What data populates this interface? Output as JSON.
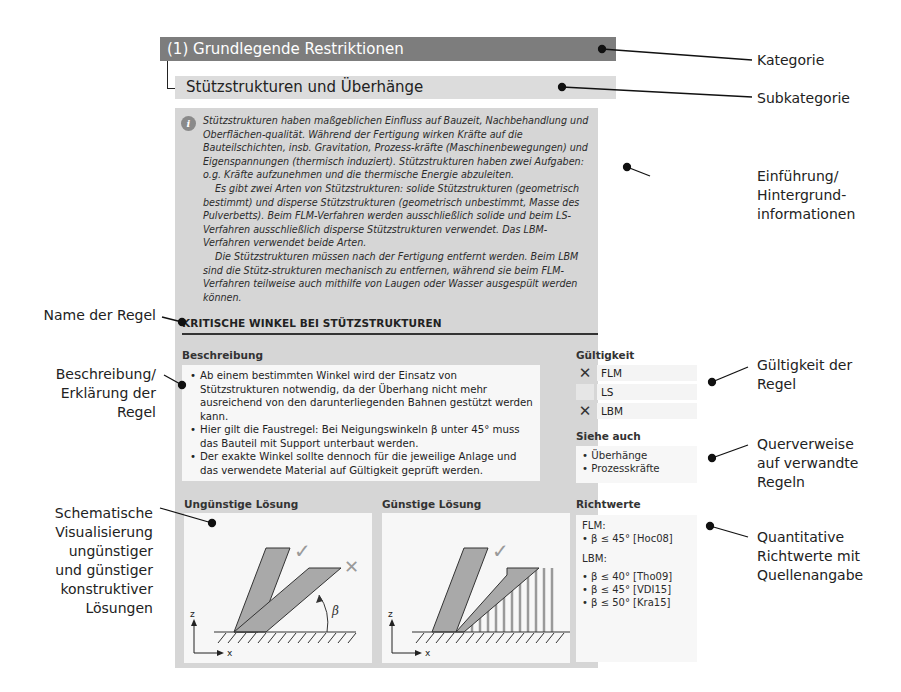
{
  "header": {
    "category": "(1) Grundlegende Restriktionen",
    "subcategory": "Stützstrukturen und Überhänge"
  },
  "intro": {
    "icon": "info-icon",
    "paragraphs": [
      "Stützstrukturen haben maßgeblichen Einfluss auf Bauzeit, Nachbehandlung und Oberflächen-qualität. Während der Fertigung wirken Kräfte auf die Bauteilschichten, insb. Gravitation, Prozess-kräfte (Maschinenbewegungen) und Eigenspannungen (thermisch induziert). Stützstrukturen haben zwei Aufgaben: o.g. Kräfte aufzunehmen und die thermische Energie abzuleiten.",
      "Es gibt zwei Arten von Stützstrukturen:  solide Stützstrukturen (geometrisch bestimmt) und disperse Stützstrukturen (geometrisch unbestimmt, Masse des Pulverbetts). Beim FLM-Verfahren werden ausschließlich solide und beim LS-Verfahren ausschließlich disperse Stützstrukturen verwendet. Das LBM-Verfahren verwendet beide Arten.",
      "Die Stützstrukturen müssen nach der Fertigung entfernt werden. Beim LBM sind die Stütz-strukturen mechanisch zu entfernen, während sie beim FLM-Verfahren teilweise auch mithilfe von Laugen oder Wasser ausgespült werden können."
    ]
  },
  "rule": {
    "name": "KRITISCHE WINKEL BEI STÜTZSTRUKTUREN",
    "description_label": "Beschreibung",
    "description_items": [
      "Ab einem bestimmten Winkel wird der Einsatz von Stützstrukturen notwendig, da der Überhang nicht mehr ausreichend von den darunterliegenden Bahnen gestützt werden kann.",
      "Hier gilt die Faustregel: Bei Neigungswinkeln β unter 45° muss das Bauteil mit Support unterbaut werden.",
      "Der exakte Winkel sollte dennoch für die jeweilige Anlage und das verwendete Material auf Gültigkeit geprüft werden."
    ],
    "validity_label": "Gültigkeit",
    "validity": [
      {
        "process": "FLM",
        "mark": "✕"
      },
      {
        "process": "LS",
        "mark": ""
      },
      {
        "process": "LBM",
        "mark": "✕"
      }
    ],
    "see_also_label": "Siehe auch",
    "see_also": [
      "Überhänge",
      "Prozesskräfte"
    ],
    "unfavorable_label": "Ungünstige Lösung",
    "favorable_label": "Günstige Lösung",
    "guide_values_label": "Richtwerte",
    "guide_values": {
      "flm_label": "FLM:",
      "flm": [
        "β ≤ 45° [Hoc08]"
      ],
      "lbm_label": "LBM:",
      "lbm": [
        "β ≤ 40° [Tho09]",
        "β ≤ 45° [VDI15]",
        "β ≤ 50° [Kra15]"
      ]
    },
    "diagram": {
      "axis_z": "z",
      "axis_x": "x",
      "angle_symbol": "β",
      "ok_mark": "✓",
      "bad_mark": "✕"
    }
  },
  "callouts": {
    "right": {
      "kategorie": "Kategorie",
      "subkategorie": "Subkategorie",
      "einfuehrung": [
        "Einführung/",
        "Hintergrund-",
        "informationen"
      ],
      "gueltigkeit": [
        "Gültigkeit der",
        "Regel"
      ],
      "querverweise": [
        "Querverweise",
        "auf verwandte",
        "Regeln"
      ],
      "richtwerte": [
        "Quantitative",
        "Richtwerte mit",
        "Quellenangabe"
      ]
    },
    "left": {
      "name": "Name der Regel",
      "beschreibung": [
        "Beschreibung/",
        "Erklärung der",
        "Regel"
      ],
      "visualisierung": [
        "Schematische",
        "Visualisierung",
        "ungünstiger",
        "und günstiger",
        "konstruktiver",
        "Lösungen"
      ]
    }
  },
  "colors": {
    "category_bar": "#7d7d7d",
    "subcategory_bar": "#dcdcdc",
    "panel": "#d6d6d6",
    "box": "#f7f7f7",
    "accent_gray": "#9a9a9a"
  }
}
